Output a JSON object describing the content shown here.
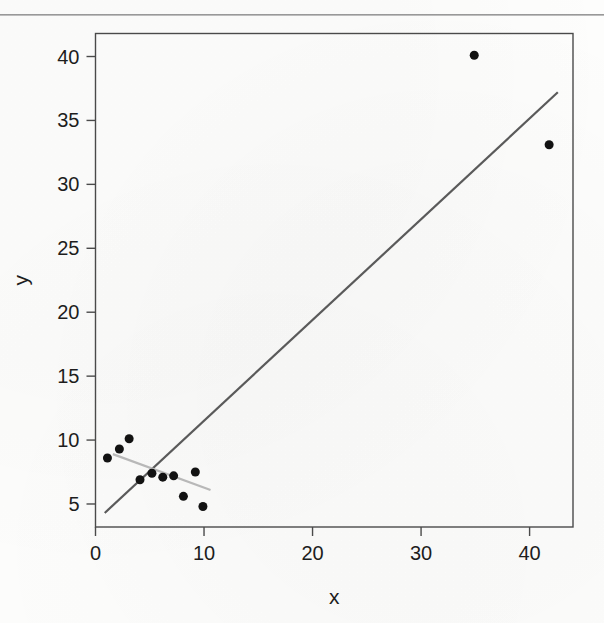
{
  "figure": {
    "background_color": "#fdfdfc",
    "has_top_rule": true,
    "top_rule_color": "#9a9a9a"
  },
  "chart_data": {
    "type": "scatter",
    "title": "",
    "subtitle": "",
    "xlabel": "x",
    "ylabel": "y",
    "xlim": [
      0.0,
      44.0
    ],
    "ylim": [
      3.2,
      41.8
    ],
    "xticks": [
      0,
      10,
      20,
      30,
      40
    ],
    "yticks": [
      5,
      10,
      15,
      20,
      25,
      30,
      35,
      40
    ],
    "xtick_labels": [
      "0",
      "10",
      "20",
      "30",
      "40"
    ],
    "ytick_labels": [
      "5",
      "10",
      "15",
      "20",
      "25",
      "30",
      "35",
      "40"
    ],
    "grid": false,
    "legend": null,
    "legend_position": "none",
    "point_color": "#121212",
    "point_marker": "circle",
    "point_size_px": 9,
    "points": [
      {
        "x": 1.1,
        "y": 8.6
      },
      {
        "x": 2.2,
        "y": 9.3
      },
      {
        "x": 3.1,
        "y": 10.1
      },
      {
        "x": 4.1,
        "y": 6.9
      },
      {
        "x": 5.2,
        "y": 7.4
      },
      {
        "x": 6.2,
        "y": 7.1
      },
      {
        "x": 7.2,
        "y": 7.2
      },
      {
        "x": 8.1,
        "y": 5.6
      },
      {
        "x": 9.2,
        "y": 7.5
      },
      {
        "x": 9.9,
        "y": 4.8
      },
      {
        "x": 34.9,
        "y": 40.1
      },
      {
        "x": 41.8,
        "y": 33.1
      }
    ],
    "lines": [
      {
        "name": "overall-fit-line",
        "color": "#5a5a5a",
        "width_px": 2.2,
        "x_start": 0.85,
        "y_start": 4.3,
        "x_end": 42.6,
        "y_end": 37.2,
        "note": "steep positive trend line driven by the two far outliers"
      },
      {
        "name": "cluster-fit-line",
        "color": "#b8b8b8",
        "width_px": 2.2,
        "x_start": 1.6,
        "y_start": 8.9,
        "x_end": 10.6,
        "y_end": 6.1,
        "note": "shallow negative trend line through the low-x cluster only"
      }
    ],
    "axes_frame": {
      "color": "#4a4a4a",
      "width_px": 1.4,
      "boxed": true
    }
  }
}
